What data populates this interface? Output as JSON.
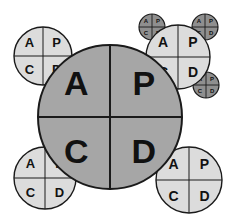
{
  "diagram": {
    "quadrant_labels": [
      "A",
      "P",
      "C",
      "D"
    ],
    "colors": {
      "background": "#ffffff",
      "core_fill": "#a6a6a6",
      "satellite_fill": "#dcdcdc",
      "mini_fill": "#8f8f8f",
      "stroke": "#1a1a1a",
      "text": "#111111"
    },
    "core": {
      "name": "core-circle",
      "cx": 110,
      "cy": 117,
      "r": 72,
      "labels": {
        "top_left": "A",
        "top_right": "P",
        "bottom_left": "C",
        "bottom_right": "D"
      },
      "font_size": 34
    },
    "satellites": [
      {
        "name": "satellite-top-left",
        "cx": 43,
        "cy": 56,
        "r": 29,
        "labels": {
          "top_left": "A",
          "top_right": "P",
          "bottom_left": "C",
          "bottom_right": "D"
        },
        "font_size": 13
      },
      {
        "name": "satellite-top-right",
        "cx": 178,
        "cy": 57,
        "r": 32,
        "labels": {
          "top_left": "A",
          "top_right": "P",
          "bottom_left": "C",
          "bottom_right": "D"
        },
        "font_size": 14
      },
      {
        "name": "satellite-bottom-left",
        "cx": 45,
        "cy": 178,
        "r": 31,
        "labels": {
          "top_left": "A",
          "top_right": "P",
          "bottom_left": "C",
          "bottom_right": "D"
        },
        "font_size": 13
      },
      {
        "name": "satellite-bottom-right",
        "cx": 189,
        "cy": 180,
        "r": 33,
        "labels": {
          "top_left": "A",
          "top_right": "P",
          "bottom_left": "C",
          "bottom_right": "D"
        },
        "font_size": 14
      }
    ],
    "minis": [
      {
        "name": "mini-top-left",
        "cx": 152,
        "cy": 27,
        "r": 13,
        "labels": {
          "top_left": "A",
          "top_right": "P",
          "bottom_left": "C",
          "bottom_right": "D"
        },
        "font_size": 6
      },
      {
        "name": "mini-top-right",
        "cx": 205,
        "cy": 27,
        "r": 13,
        "labels": {
          "top_left": "A",
          "top_right": "P",
          "bottom_left": "C",
          "bottom_right": "D"
        },
        "font_size": 6
      },
      {
        "name": "mini-bottom-left",
        "cx": 151,
        "cy": 85,
        "r": 13,
        "labels": {
          "top_left": "A",
          "top_right": "P",
          "bottom_left": "C",
          "bottom_right": "D"
        },
        "font_size": 6
      },
      {
        "name": "mini-bottom-right",
        "cx": 206,
        "cy": 85,
        "r": 13,
        "labels": {
          "top_left": "A",
          "top_right": "P",
          "bottom_left": "C",
          "bottom_right": "D"
        },
        "font_size": 6
      }
    ]
  }
}
